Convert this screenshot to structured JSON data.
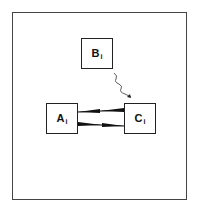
{
  "diagram": {
    "nodes": [
      {
        "id": "B",
        "letter": "B",
        "subscript": "i"
      },
      {
        "id": "A",
        "letter": "A",
        "subscript": "i"
      },
      {
        "id": "C",
        "letter": "C",
        "subscript": "i"
      }
    ],
    "edges": [
      {
        "from": "B",
        "to": "C",
        "style": "wavy"
      },
      {
        "from": "C",
        "to": "A",
        "style": "tapered-arrow"
      },
      {
        "from": "A",
        "to": "C",
        "style": "tapered-arrow"
      }
    ]
  }
}
